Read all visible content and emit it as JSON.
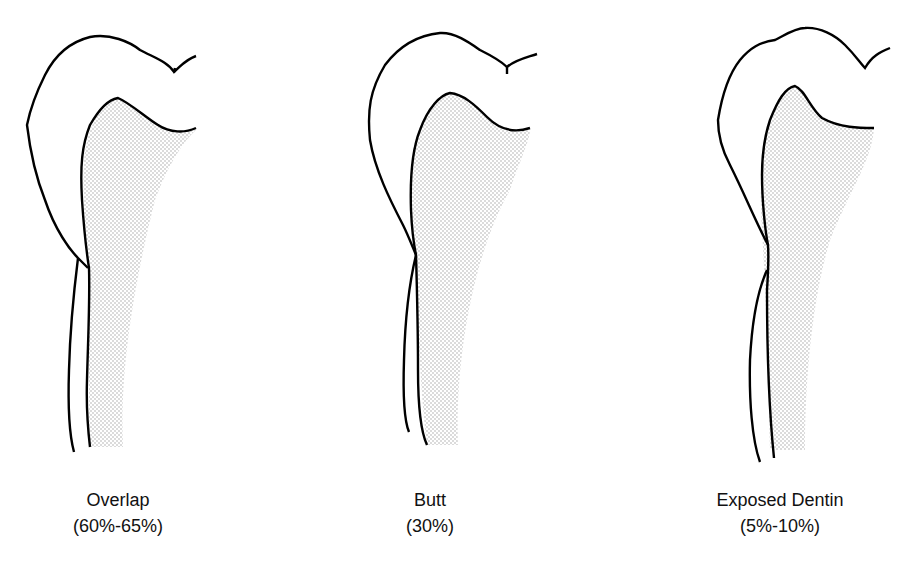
{
  "figure": {
    "panels": [
      {
        "title": "Overlap",
        "percent": "(60%-65%)"
      },
      {
        "title": "Butt",
        "percent": "(30%)"
      },
      {
        "title": "Exposed Dentin",
        "percent": "(5%-10%)"
      }
    ],
    "colors": {
      "line": "#000000",
      "stipple": "#9a9a9a",
      "background": "#ffffff"
    }
  }
}
